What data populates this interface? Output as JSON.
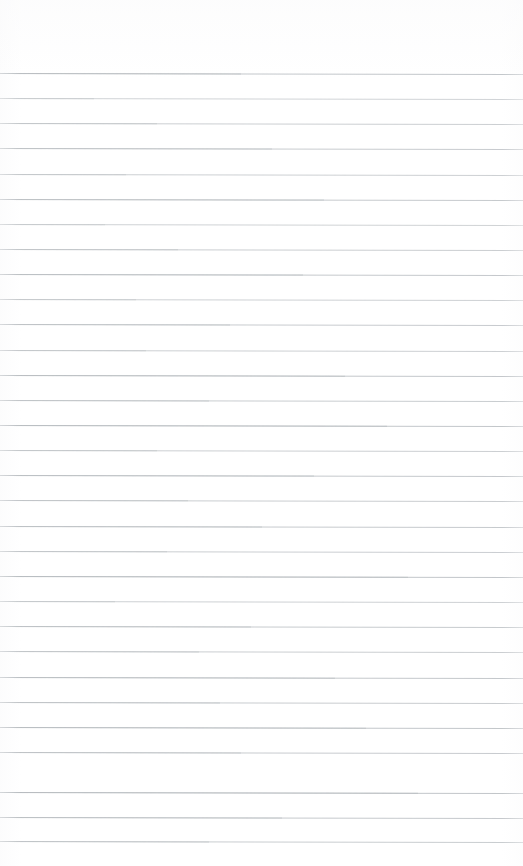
{
  "document": {
    "kind": "ruled-paper-scan",
    "title": "Blank lined paper",
    "page_width": 523,
    "page_height": 866,
    "background_color": "#ffffff",
    "written_content": "",
    "text_content_present": "none"
  },
  "ruling": {
    "line_color": "#bfc3c7",
    "line_color_dark": "#a9aeb3",
    "line_thickness_px": 1,
    "line_spacing_px": 25.2,
    "first_line_y_px": 73,
    "line_count": 31,
    "left_inset_px": 0,
    "right_inset_px": 0,
    "tilt_deg": 0.11,
    "top_margin_px": 73,
    "bottom_margin_px": 25,
    "lines": [
      {
        "index": 1,
        "y": 73,
        "opacity": 0.95,
        "wash_start_pct": 0,
        "wash_width_pct": 46
      },
      {
        "index": 2,
        "y": 98,
        "opacity": 0.72,
        "wash_start_pct": 0,
        "wash_width_pct": 18
      },
      {
        "index": 3,
        "y": 123,
        "opacity": 0.8,
        "wash_start_pct": 0,
        "wash_width_pct": 30
      },
      {
        "index": 4,
        "y": 148,
        "opacity": 0.85,
        "wash_start_pct": 0,
        "wash_width_pct": 52
      },
      {
        "index": 5,
        "y": 174,
        "opacity": 0.78,
        "wash_start_pct": 0,
        "wash_width_pct": 24
      },
      {
        "index": 6,
        "y": 199,
        "opacity": 0.88,
        "wash_start_pct": 0,
        "wash_width_pct": 62
      },
      {
        "index": 7,
        "y": 224,
        "opacity": 0.74,
        "wash_start_pct": 0,
        "wash_width_pct": 20
      },
      {
        "index": 8,
        "y": 249,
        "opacity": 0.82,
        "wash_start_pct": 0,
        "wash_width_pct": 34
      },
      {
        "index": 9,
        "y": 274,
        "opacity": 0.9,
        "wash_start_pct": 0,
        "wash_width_pct": 58
      },
      {
        "index": 10,
        "y": 299,
        "opacity": 0.76,
        "wash_start_pct": 0,
        "wash_width_pct": 26
      },
      {
        "index": 11,
        "y": 324,
        "opacity": 0.86,
        "wash_start_pct": 0,
        "wash_width_pct": 44
      },
      {
        "index": 12,
        "y": 350,
        "opacity": 0.79,
        "wash_start_pct": 0,
        "wash_width_pct": 28
      },
      {
        "index": 13,
        "y": 375,
        "opacity": 0.92,
        "wash_start_pct": 0,
        "wash_width_pct": 66
      },
      {
        "index": 14,
        "y": 400,
        "opacity": 0.84,
        "wash_start_pct": 0,
        "wash_width_pct": 40
      },
      {
        "index": 15,
        "y": 425,
        "opacity": 0.93,
        "wash_start_pct": 0,
        "wash_width_pct": 74
      },
      {
        "index": 16,
        "y": 450,
        "opacity": 0.8,
        "wash_start_pct": 0,
        "wash_width_pct": 30
      },
      {
        "index": 17,
        "y": 475,
        "opacity": 0.9,
        "wash_start_pct": 0,
        "wash_width_pct": 60
      },
      {
        "index": 18,
        "y": 500,
        "opacity": 0.83,
        "wash_start_pct": 0,
        "wash_width_pct": 36
      },
      {
        "index": 19,
        "y": 526,
        "opacity": 0.88,
        "wash_start_pct": 0,
        "wash_width_pct": 50
      },
      {
        "index": 20,
        "y": 551,
        "opacity": 0.81,
        "wash_start_pct": 0,
        "wash_width_pct": 32
      },
      {
        "index": 21,
        "y": 576,
        "opacity": 0.94,
        "wash_start_pct": 0,
        "wash_width_pct": 78
      },
      {
        "index": 22,
        "y": 601,
        "opacity": 0.77,
        "wash_start_pct": 0,
        "wash_width_pct": 22
      },
      {
        "index": 23,
        "y": 626,
        "opacity": 0.87,
        "wash_start_pct": 0,
        "wash_width_pct": 48
      },
      {
        "index": 24,
        "y": 651,
        "opacity": 0.82,
        "wash_start_pct": 0,
        "wash_width_pct": 38
      },
      {
        "index": 25,
        "y": 677,
        "opacity": 0.91,
        "wash_start_pct": 0,
        "wash_width_pct": 64
      },
      {
        "index": 26,
        "y": 702,
        "opacity": 0.85,
        "wash_start_pct": 0,
        "wash_width_pct": 42
      },
      {
        "index": 27,
        "y": 727,
        "opacity": 0.93,
        "wash_start_pct": 0,
        "wash_width_pct": 70
      },
      {
        "index": 28,
        "y": 752,
        "opacity": 0.86,
        "wash_start_pct": 0,
        "wash_width_pct": 46
      },
      {
        "index": 29,
        "y": 792,
        "opacity": 0.95,
        "wash_start_pct": 0,
        "wash_width_pct": 80
      },
      {
        "index": 30,
        "y": 817,
        "opacity": 0.89,
        "wash_start_pct": 0,
        "wash_width_pct": 54
      },
      {
        "index": 31,
        "y": 841,
        "opacity": 0.84,
        "wash_start_pct": 0,
        "wash_width_pct": 40
      }
    ]
  }
}
